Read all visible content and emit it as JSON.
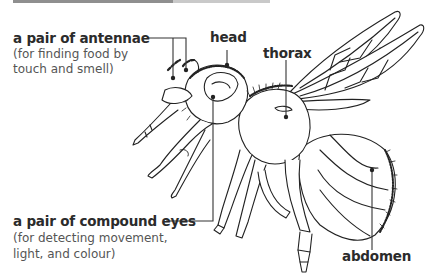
{
  "diagram": {
    "labels": {
      "antennae": {
        "title": "a pair of antennae",
        "description_line1": "(for finding food by",
        "description_line2": "touch and smell)"
      },
      "head": {
        "title": "head"
      },
      "thorax": {
        "title": "thorax"
      },
      "compound_eyes": {
        "title": "a pair of compound eyes",
        "description_line1": "(for detecting movement,",
        "description_line2": "light, and colour)"
      },
      "abdomen": {
        "title": "abdomen"
      }
    },
    "colors": {
      "label_text": "#2b2b2b",
      "description_text": "#555555",
      "line_art": "#222222",
      "leader_line": "#333333",
      "topbar_dark": "#8f8f8f",
      "topbar_light": "#c9c9c9"
    }
  }
}
